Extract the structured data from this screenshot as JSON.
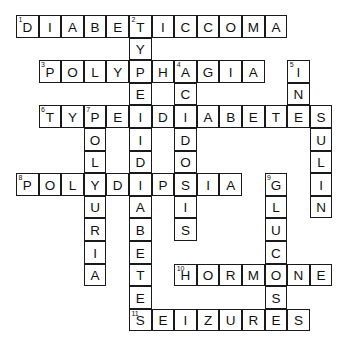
{
  "puzzle": {
    "title": "Diabetes Crossword Puzzle",
    "grid": {
      "columns": 14,
      "rows": 14,
      "cell_size": 22.6,
      "origin_x": 16,
      "origin_y": 15,
      "border_color": "#1a1a1a",
      "cell_background": "#ffffff",
      "page_background": "#ffffff"
    },
    "entries": [
      {
        "number": "1",
        "direction": "across",
        "row": 1,
        "col": 1,
        "answer": "DIABETICCOMA"
      },
      {
        "number": "2",
        "direction": "down",
        "row": 1,
        "col": 6,
        "answer": "TYPEIIDIABETES"
      },
      {
        "number": "3",
        "direction": "across",
        "row": 3,
        "col": 2,
        "answer": "POLYPHAGIA"
      },
      {
        "number": "4",
        "direction": "down",
        "row": 3,
        "col": 8,
        "answer": "ACIDOSIS"
      },
      {
        "number": "5",
        "direction": "down",
        "row": 3,
        "col": 13,
        "answer": "INSULIN"
      },
      {
        "number": "6",
        "direction": "across",
        "row": 5,
        "col": 2,
        "answer": "TYPEIDIABETES"
      },
      {
        "number": "7",
        "direction": "down",
        "row": 5,
        "col": 4,
        "answer": "POLYURIA"
      },
      {
        "number": "8",
        "direction": "across",
        "row": 8,
        "col": 1,
        "answer": "POLYDIPSIA"
      },
      {
        "number": "9",
        "direction": "down",
        "row": 8,
        "col": 12,
        "answer": "GLUCOSE"
      },
      {
        "number": "10",
        "direction": "across",
        "row": 12,
        "col": 8,
        "answer": "HORMONE"
      },
      {
        "number": "11",
        "direction": "across",
        "row": 14,
        "col": 6,
        "answer": "SEIZURES"
      }
    ],
    "cells": [
      {
        "row": 1,
        "col": 1,
        "letter": "D",
        "number": "1"
      },
      {
        "row": 1,
        "col": 2,
        "letter": "I"
      },
      {
        "row": 1,
        "col": 3,
        "letter": "A"
      },
      {
        "row": 1,
        "col": 4,
        "letter": "B"
      },
      {
        "row": 1,
        "col": 5,
        "letter": "E"
      },
      {
        "row": 1,
        "col": 6,
        "letter": "T",
        "number": "2"
      },
      {
        "row": 1,
        "col": 7,
        "letter": "I"
      },
      {
        "row": 1,
        "col": 8,
        "letter": "C"
      },
      {
        "row": 1,
        "col": 9,
        "letter": "C"
      },
      {
        "row": 1,
        "col": 10,
        "letter": "O"
      },
      {
        "row": 1,
        "col": 11,
        "letter": "M"
      },
      {
        "row": 1,
        "col": 12,
        "letter": "A"
      },
      {
        "row": 2,
        "col": 6,
        "letter": "Y"
      },
      {
        "row": 3,
        "col": 2,
        "letter": "P",
        "number": "3"
      },
      {
        "row": 3,
        "col": 3,
        "letter": "O"
      },
      {
        "row": 3,
        "col": 4,
        "letter": "L"
      },
      {
        "row": 3,
        "col": 5,
        "letter": "Y"
      },
      {
        "row": 3,
        "col": 6,
        "letter": "P"
      },
      {
        "row": 3,
        "col": 7,
        "letter": "H"
      },
      {
        "row": 3,
        "col": 8,
        "letter": "A",
        "number": "4"
      },
      {
        "row": 3,
        "col": 9,
        "letter": "G"
      },
      {
        "row": 3,
        "col": 10,
        "letter": "I"
      },
      {
        "row": 3,
        "col": 11,
        "letter": "A"
      },
      {
        "row": 3,
        "col": 13,
        "letter": "I",
        "number": "5"
      },
      {
        "row": 4,
        "col": 6,
        "letter": "E"
      },
      {
        "row": 4,
        "col": 8,
        "letter": "C"
      },
      {
        "row": 4,
        "col": 13,
        "letter": "N"
      },
      {
        "row": 5,
        "col": 2,
        "letter": "T",
        "number": "6"
      },
      {
        "row": 5,
        "col": 3,
        "letter": "Y"
      },
      {
        "row": 5,
        "col": 4,
        "letter": "P",
        "number": "7"
      },
      {
        "row": 5,
        "col": 5,
        "letter": "E"
      },
      {
        "row": 5,
        "col": 6,
        "letter": "I"
      },
      {
        "row": 5,
        "col": 7,
        "letter": "D"
      },
      {
        "row": 5,
        "col": 8,
        "letter": "I"
      },
      {
        "row": 5,
        "col": 9,
        "letter": "A"
      },
      {
        "row": 5,
        "col": 10,
        "letter": "B"
      },
      {
        "row": 5,
        "col": 11,
        "letter": "E"
      },
      {
        "row": 5,
        "col": 12,
        "letter": "T"
      },
      {
        "row": 5,
        "col": 13,
        "letter": "E"
      },
      {
        "row": 5,
        "col": 14,
        "letter": "S"
      },
      {
        "row": 6,
        "col": 4,
        "letter": "O"
      },
      {
        "row": 6,
        "col": 6,
        "letter": "I"
      },
      {
        "row": 6,
        "col": 8,
        "letter": "D"
      },
      {
        "row": 6,
        "col": 14,
        "letter": "U"
      },
      {
        "row": 7,
        "col": 4,
        "letter": "L"
      },
      {
        "row": 7,
        "col": 6,
        "letter": "D"
      },
      {
        "row": 7,
        "col": 8,
        "letter": "O"
      },
      {
        "row": 7,
        "col": 14,
        "letter": "L"
      },
      {
        "row": 8,
        "col": 1,
        "letter": "P",
        "number": "8"
      },
      {
        "row": 8,
        "col": 2,
        "letter": "O"
      },
      {
        "row": 8,
        "col": 3,
        "letter": "L"
      },
      {
        "row": 8,
        "col": 4,
        "letter": "Y"
      },
      {
        "row": 8,
        "col": 5,
        "letter": "D"
      },
      {
        "row": 8,
        "col": 6,
        "letter": "I"
      },
      {
        "row": 8,
        "col": 7,
        "letter": "P"
      },
      {
        "row": 8,
        "col": 8,
        "letter": "S"
      },
      {
        "row": 8,
        "col": 9,
        "letter": "I"
      },
      {
        "row": 8,
        "col": 10,
        "letter": "A"
      },
      {
        "row": 8,
        "col": 12,
        "letter": "G",
        "number": "9"
      },
      {
        "row": 8,
        "col": 14,
        "letter": "I"
      },
      {
        "row": 9,
        "col": 4,
        "letter": "U"
      },
      {
        "row": 9,
        "col": 6,
        "letter": "A"
      },
      {
        "row": 9,
        "col": 8,
        "letter": "I"
      },
      {
        "row": 9,
        "col": 12,
        "letter": "L"
      },
      {
        "row": 9,
        "col": 14,
        "letter": "N"
      },
      {
        "row": 10,
        "col": 4,
        "letter": "R"
      },
      {
        "row": 10,
        "col": 6,
        "letter": "B"
      },
      {
        "row": 10,
        "col": 8,
        "letter": "S"
      },
      {
        "row": 10,
        "col": 12,
        "letter": "U"
      },
      {
        "row": 11,
        "col": 4,
        "letter": "I"
      },
      {
        "row": 11,
        "col": 6,
        "letter": "E"
      },
      {
        "row": 11,
        "col": 12,
        "letter": "C"
      },
      {
        "row": 12,
        "col": 4,
        "letter": "A"
      },
      {
        "row": 12,
        "col": 6,
        "letter": "T"
      },
      {
        "row": 12,
        "col": 8,
        "letter": "H",
        "number": "10"
      },
      {
        "row": 12,
        "col": 9,
        "letter": "O"
      },
      {
        "row": 12,
        "col": 10,
        "letter": "R"
      },
      {
        "row": 12,
        "col": 11,
        "letter": "M"
      },
      {
        "row": 12,
        "col": 12,
        "letter": "O"
      },
      {
        "row": 12,
        "col": 13,
        "letter": "N"
      },
      {
        "row": 12,
        "col": 14,
        "letter": "E"
      },
      {
        "row": 13,
        "col": 6,
        "letter": "E"
      },
      {
        "row": 13,
        "col": 12,
        "letter": "S"
      },
      {
        "row": 14,
        "col": 6,
        "letter": "S",
        "number": "11"
      },
      {
        "row": 14,
        "col": 7,
        "letter": "E"
      },
      {
        "row": 14,
        "col": 8,
        "letter": "I"
      },
      {
        "row": 14,
        "col": 9,
        "letter": "Z"
      },
      {
        "row": 14,
        "col": 10,
        "letter": "U"
      },
      {
        "row": 14,
        "col": 11,
        "letter": "R"
      },
      {
        "row": 14,
        "col": 12,
        "letter": "E"
      },
      {
        "row": 14,
        "col": 13,
        "letter": "S"
      }
    ]
  }
}
